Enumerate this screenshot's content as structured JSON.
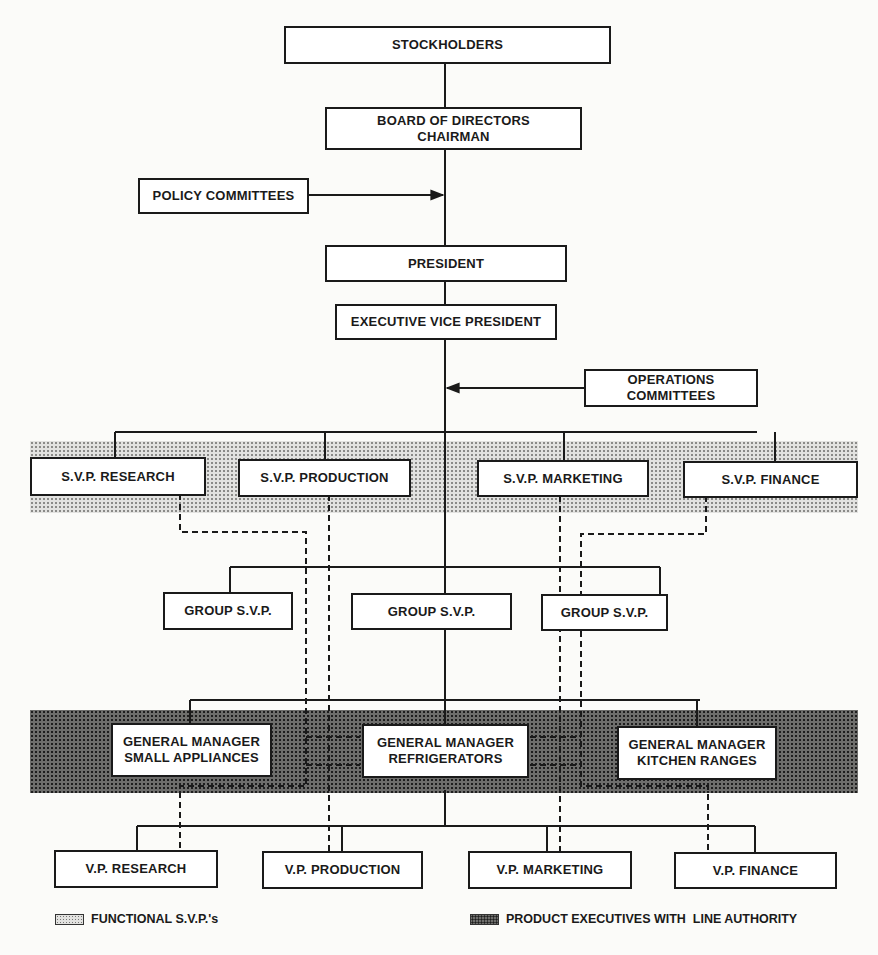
{
  "chart": {
    "boxes": {
      "stockholders": {
        "lines": [
          "STOCKHOLDERS"
        ]
      },
      "board": {
        "lines": [
          "BOARD OF DIRECTORS",
          "CHAIRMAN"
        ]
      },
      "policy_committees": {
        "lines": [
          "POLICY COMMITTEES"
        ]
      },
      "president": {
        "lines": [
          "PRESIDENT"
        ]
      },
      "exec_vp": {
        "lines": [
          "EXECUTIVE VICE PRESIDENT"
        ]
      },
      "operations_committees": {
        "lines": [
          "OPERATIONS",
          "COMMITTEES"
        ]
      },
      "svp_research": {
        "lines": [
          "S.V.P. RESEARCH"
        ]
      },
      "svp_production": {
        "lines": [
          "S.V.P. PRODUCTION"
        ]
      },
      "svp_marketing": {
        "lines": [
          "S.V.P. MARKETING"
        ]
      },
      "svp_finance": {
        "lines": [
          "S.V.P. FINANCE"
        ]
      },
      "group_svp_left": {
        "lines": [
          "GROUP S.V.P."
        ]
      },
      "group_svp_center": {
        "lines": [
          "GROUP S.V.P."
        ]
      },
      "group_svp_right": {
        "lines": [
          "GROUP S.V.P."
        ]
      },
      "gm_small_appliances": {
        "lines": [
          "GENERAL MANAGER",
          "SMALL APPLIANCES"
        ]
      },
      "gm_refrigerators": {
        "lines": [
          "GENERAL MANAGER",
          "REFRIGERATORS"
        ]
      },
      "gm_kitchen_ranges": {
        "lines": [
          "GENERAL MANAGER",
          "KITCHEN RANGES"
        ]
      },
      "vp_research": {
        "lines": [
          "V.P. RESEARCH"
        ]
      },
      "vp_production": {
        "lines": [
          "V.P. PRODUCTION"
        ]
      },
      "vp_marketing": {
        "lines": [
          "V.P. MARKETING"
        ]
      },
      "vp_finance": {
        "lines": [
          "V.P. FINANCE"
        ]
      }
    },
    "legend": {
      "functional": "FUNCTIONAL S.V.P.'s",
      "product": "PRODUCT EXECUTIVES WITH  LINE AUTHORITY"
    },
    "colors": {
      "line": "#1a1a1a",
      "light_band": "#e2e2e0",
      "dark_band": "#6e6e6c"
    }
  }
}
